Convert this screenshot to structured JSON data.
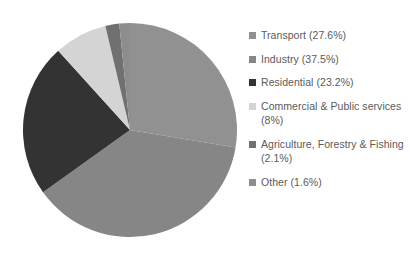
{
  "chart_data": {
    "type": "pie",
    "title": "",
    "subtitle": "",
    "xlabel": "",
    "ylabel": "",
    "grid": false,
    "legend_position": "right",
    "start_angle_deg": 0,
    "direction": "clockwise",
    "center": {
      "x": 130,
      "y": 130
    },
    "radius": 107,
    "categories": [
      "Transport",
      "Industry",
      "Residential",
      "Commercial & Public services",
      "Agriculture, Forestry & Fishing",
      "Other"
    ],
    "values": [
      27.6,
      37.5,
      23.2,
      8.0,
      2.1,
      1.6
    ],
    "value_unit": "%",
    "colors": [
      "#919191",
      "#868686",
      "#333333",
      "#d4d4d4",
      "#707070",
      "#8d8d8d"
    ],
    "slices": [
      {
        "label": "Transport",
        "value": 27.6,
        "color": "#919191",
        "legend_text": "Transport (27.6%)"
      },
      {
        "label": "Industry",
        "value": 37.5,
        "color": "#868686",
        "legend_text": "Industry (37.5%)"
      },
      {
        "label": "Residential",
        "value": 23.2,
        "color": "#333333",
        "legend_text": "Residential (23.2%)"
      },
      {
        "label": "Commercial & Public services",
        "value": 8.0,
        "color": "#d4d4d4",
        "legend_text": "Commercial & Public services (8%)"
      },
      {
        "label": "Agriculture, Forestry & Fishing",
        "value": 2.1,
        "color": "#707070",
        "legend_text": "Agriculture, Forestry & Fishing (2.1%)"
      },
      {
        "label": "Other",
        "value": 1.6,
        "color": "#8d8d8d",
        "legend_text": "Other (1.6%)"
      }
    ]
  },
  "legend": {
    "items": [
      {
        "text": "Transport (27.6%)",
        "color": "#919191"
      },
      {
        "text": "Industry (37.5%)",
        "color": "#868686"
      },
      {
        "text": "Residential (23.2%)",
        "color": "#333333"
      },
      {
        "text": "Commercial & Public services (8%)",
        "color": "#d4d4d4"
      },
      {
        "text": "Agriculture, Forestry & Fishing (2.1%)",
        "color": "#707070"
      },
      {
        "text": "Other (1.6%)",
        "color": "#8d8d8d"
      }
    ]
  }
}
